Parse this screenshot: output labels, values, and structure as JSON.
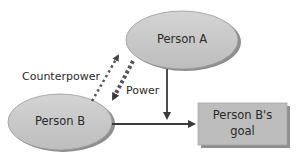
{
  "diagram": {
    "nodes": {
      "person_a": {
        "label": "Person A",
        "shape": "ellipse"
      },
      "person_b": {
        "label": "Person B",
        "shape": "ellipse"
      },
      "goal": {
        "label_line1": "Person B's",
        "label_line2": "goal",
        "shape": "rectangle"
      }
    },
    "edges": {
      "power": {
        "label": "Power",
        "from": "Person A",
        "to": "Person B",
        "style": "thick-dotted"
      },
      "counterpower": {
        "label": "Counterpower",
        "from": "Person B",
        "to": "Person A",
        "style": "thin-dotted"
      },
      "a_to_goal_path": {
        "from": "Person A",
        "to": "B-to-goal arrow",
        "style": "solid"
      },
      "b_to_goal": {
        "from": "Person B",
        "to": "Person B's goal",
        "style": "solid"
      }
    },
    "colors": {
      "node_fill": "#c8c8c8",
      "node_shadow": "#8e8e8e",
      "box_fill": "#bdbdbd",
      "arrow": "#3a3a3a",
      "text": "#2a2a2a"
    }
  }
}
